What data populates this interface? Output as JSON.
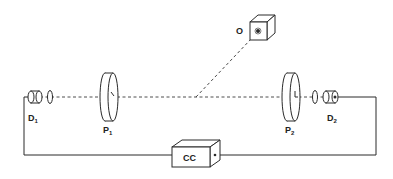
{
  "diagram": {
    "type": "optical-setup",
    "colors": {
      "line": "#2a2a2a",
      "background": "#ffffff"
    },
    "components": {
      "source": {
        "label": "O",
        "shape": "cube"
      },
      "detector_left": {
        "label": "D",
        "subscript": "1"
      },
      "detector_right": {
        "label": "D",
        "subscript": "2"
      },
      "polarizer_left": {
        "label": "P",
        "subscript": "1"
      },
      "polarizer_right": {
        "label": "P",
        "subscript": "2"
      },
      "counter": {
        "label": "CC",
        "shape": "box"
      }
    },
    "connections": [
      {
        "from": "O",
        "to": "beam-center",
        "style": "dashed"
      },
      {
        "from": "D1",
        "to": "P1",
        "style": "dashed",
        "via": [
          "lens-left"
        ]
      },
      {
        "from": "P1",
        "to": "P2",
        "style": "dashed"
      },
      {
        "from": "P2",
        "to": "D2",
        "style": "dashed",
        "via": [
          "lens-right"
        ]
      },
      {
        "from": "D1",
        "to": "CC",
        "style": "solid-wire"
      },
      {
        "from": "D2",
        "to": "CC",
        "style": "solid-wire"
      }
    ]
  }
}
